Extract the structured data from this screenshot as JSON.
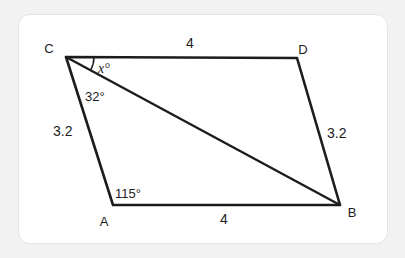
{
  "figure": {
    "kind": "geometry-diagram",
    "shape": "parallelogram-with-diagonal",
    "background_color": "#f2f2f2",
    "card_color": "#ffffff",
    "stroke_color": "#1c1c1c",
    "vertices": [
      {
        "name": "C",
        "label": "C",
        "x": 66,
        "y": 57,
        "label_x": 49,
        "label_y": 53
      },
      {
        "name": "D",
        "label": "D",
        "x": 297,
        "y": 58,
        "label_x": 303,
        "label_y": 54
      },
      {
        "name": "A",
        "label": "A",
        "x": 113,
        "y": 205,
        "label_x": 104,
        "label_y": 226
      },
      {
        "name": "B",
        "label": "B",
        "x": 340,
        "y": 205,
        "label_x": 352,
        "label_y": 217
      }
    ],
    "edges": [
      {
        "name": "edge-CD",
        "from": "C",
        "to": "D",
        "length_label": "4",
        "label_x": 190,
        "label_y": 48
      },
      {
        "name": "edge-DB",
        "from": "D",
        "to": "B",
        "length_label": "3.2",
        "label_x": 327,
        "label_y": 138
      },
      {
        "name": "edge-AB",
        "from": "A",
        "to": "B",
        "length_label": "4",
        "label_x": 224,
        "label_y": 224
      },
      {
        "name": "edge-CA",
        "from": "C",
        "to": "A",
        "length_label": "3.2",
        "label_x": 53,
        "label_y": 136
      }
    ],
    "diagonal": {
      "name": "diagonal-CB",
      "from": "C",
      "to": "B"
    },
    "angles": [
      {
        "name": "angle-x",
        "label": "x°",
        "at_vertex": "C",
        "between": "CD-and-CB",
        "label_x": 98,
        "label_y": 73,
        "has_arc": true,
        "arc_radius": 28
      },
      {
        "name": "angle-32",
        "label": "32°",
        "at_vertex": "C",
        "between": "CB-and-CA",
        "label_x": 85,
        "label_y": 101,
        "has_arc": false
      },
      {
        "name": "angle-115",
        "label": "115°",
        "at_vertex": "A",
        "between": "AC-and-AB",
        "label_x": 115,
        "label_y": 198,
        "has_arc": false
      }
    ]
  }
}
